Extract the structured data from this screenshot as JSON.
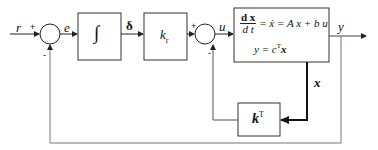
{
  "diagram": {
    "signals": {
      "reference": "r",
      "error": "e",
      "integral_state": "δ",
      "control": "u",
      "output": "y",
      "state": "x"
    },
    "summers": [
      {
        "id": "sum1",
        "plus_label": "+",
        "minus_label": "-"
      },
      {
        "id": "sum2",
        "plus_label": "+",
        "minus_label": "-"
      }
    ],
    "blocks": {
      "integrator": {
        "symbol": "∫"
      },
      "gain_kr": {
        "base": "k",
        "sub": "r"
      },
      "plant": {
        "line1_num": "d x",
        "line1_den": "d t",
        "line1_rhs": "= ẋ = A x + b u",
        "line2_lhs": "y = c",
        "line2_sup": "T",
        "line2_rhs": "x"
      },
      "gain_kT": {
        "base": "k",
        "sup": "T"
      }
    },
    "colors": {
      "line": "#222222",
      "box": "#333333",
      "feedback": "#777777"
    }
  }
}
